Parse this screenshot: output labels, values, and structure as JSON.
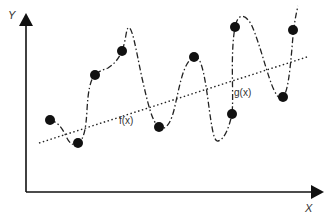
{
  "diagram": {
    "axes": {
      "y_label": "Y",
      "x_label": "X"
    },
    "labels": {
      "f": "f(x)",
      "g": "g(x)"
    },
    "points": [
      {
        "x": 50,
        "y": 120
      },
      {
        "x": 78,
        "y": 143
      },
      {
        "x": 95,
        "y": 75
      },
      {
        "x": 122,
        "y": 51
      },
      {
        "x": 159,
        "y": 127
      },
      {
        "x": 194,
        "y": 57
      },
      {
        "x": 232,
        "y": 114
      },
      {
        "x": 235,
        "y": 27
      },
      {
        "x": 283,
        "y": 97
      },
      {
        "x": 293,
        "y": 30
      }
    ],
    "legend": {
      "f_desc": "dotted straight line (linear fit)",
      "g_desc": "dash-dot oscillating curve (interpolating all points)"
    },
    "colors": {
      "ink": "#111111",
      "background": "#ffffff"
    }
  }
}
